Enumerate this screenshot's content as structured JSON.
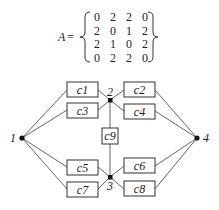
{
  "matrix": {
    "label": "A",
    "equals": "=",
    "rows": [
      [
        "0",
        "2",
        "2",
        "0"
      ],
      [
        "2",
        "0",
        "1",
        "2"
      ],
      [
        "2",
        "1",
        "0",
        "2"
      ],
      [
        "0",
        "2",
        "2",
        "0"
      ]
    ]
  },
  "nodes": [
    {
      "id": "1",
      "label": "1"
    },
    {
      "id": "2",
      "label": "2"
    },
    {
      "id": "3",
      "label": "3"
    },
    {
      "id": "4",
      "label": "4"
    }
  ],
  "components": [
    {
      "id": "c1",
      "label": "c1"
    },
    {
      "id": "c2",
      "label": "c2"
    },
    {
      "id": "c3",
      "label": "c3"
    },
    {
      "id": "c4",
      "label": "c4"
    },
    {
      "id": "c5",
      "label": "c5"
    },
    {
      "id": "c6",
      "label": "c6"
    },
    {
      "id": "c7",
      "label": "c7"
    },
    {
      "id": "c8",
      "label": "c8"
    },
    {
      "id": "c9",
      "label": "c9"
    }
  ],
  "colors": {
    "line": "#555555",
    "node": "#111111",
    "text": "#222222",
    "box_border": "#333333"
  }
}
